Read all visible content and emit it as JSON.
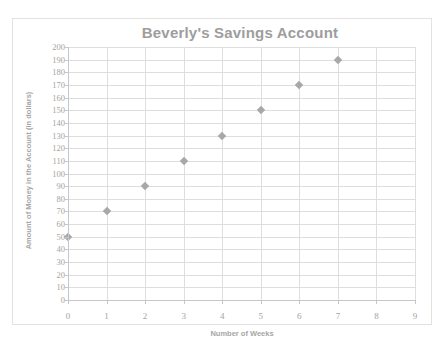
{
  "chart_data": {
    "type": "scatter",
    "title": "Beverly's Savings Account",
    "xlabel": "Number of Weeks",
    "ylabel": "Amount of Money in the Account (in dollars)",
    "x": [
      0,
      1,
      2,
      3,
      4,
      5,
      6,
      7
    ],
    "values": [
      50,
      70,
      90,
      110,
      130,
      150,
      170,
      190
    ],
    "points": [
      {
        "x": 0,
        "y": 50
      },
      {
        "x": 1,
        "y": 70
      },
      {
        "x": 2,
        "y": 90
      },
      {
        "x": 3,
        "y": 110
      },
      {
        "x": 4,
        "y": 130
      },
      {
        "x": 5,
        "y": 150
      },
      {
        "x": 6,
        "y": 170
      },
      {
        "x": 7,
        "y": 190
      }
    ],
    "xlim": [
      0,
      9
    ],
    "ylim": [
      0,
      200
    ],
    "x_ticks": [
      "0",
      "1",
      "2",
      "3",
      "4",
      "5",
      "6",
      "7",
      "8",
      "9"
    ],
    "y_ticks": [
      "200",
      "190",
      "180",
      "170",
      "160",
      "150",
      "140",
      "130",
      "120",
      "110",
      "100",
      "90",
      "80",
      "70",
      "60",
      "50",
      "40",
      "30",
      "20",
      "10",
      "0"
    ],
    "x_tick_step": 1,
    "y_tick_step": 10,
    "grid": {
      "horizontal": true,
      "vertical": true
    },
    "legend": null,
    "marker": "diamond",
    "colors": {
      "marker": "#a8a8a8",
      "grid": "#dedede",
      "axis": "#c7c7c7",
      "title_text": "#9d9d9d",
      "tick_text": "#a3a3a3",
      "axis_title_text": "#a6a6a6",
      "frame_border": "#e2e2e2",
      "background": "#ffffff"
    }
  }
}
